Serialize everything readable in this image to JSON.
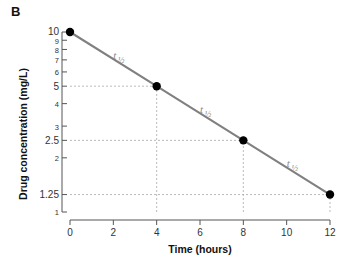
{
  "figure": {
    "panel_label": "B",
    "xlabel": "Time (hours)",
    "ylabel": "Drug concentration (mg/L)"
  },
  "colors": {
    "line": "#808080",
    "point": "#000000",
    "axis": "#555555",
    "guide": "#aaaaaa",
    "annotation": "#8c8c8c",
    "text": "#111111",
    "background": "#ffffff"
  },
  "chart_data": {
    "type": "line",
    "title": "",
    "subtitle": "",
    "panel": "B",
    "xlabel": "Time (hours)",
    "ylabel": "Drug concentration (mg/L)",
    "yscale": "log",
    "xscale": "linear",
    "xlim": [
      0,
      12
    ],
    "ylim": [
      1,
      10
    ],
    "grid": false,
    "legend": "none",
    "x": [
      0,
      4,
      8,
      12
    ],
    "values": [
      10,
      5,
      2.5,
      1.25
    ],
    "series": [
      {
        "name": "Drug concentration",
        "x": [
          0,
          4,
          8,
          12
        ],
        "values": [
          10,
          5,
          2.5,
          1.25
        ],
        "marker": "filled-circle"
      }
    ],
    "xticks": [
      0,
      2,
      4,
      6,
      8,
      10,
      12
    ],
    "xticklabels": [
      "0",
      "2",
      "4",
      "6",
      "8",
      "10",
      "12"
    ],
    "yticks": [
      10,
      9,
      8,
      7,
      6,
      5,
      4,
      3,
      2.5,
      2,
      1.25,
      1
    ],
    "yticklabels": [
      "10",
      "9",
      "8",
      "7",
      "6",
      "5",
      "4",
      "3",
      "2.5",
      "2",
      "1.25",
      "1"
    ],
    "annotations": [
      {
        "text": "t",
        "subscript": "1/2",
        "x_data": 2,
        "y_data": 7.1
      },
      {
        "text": "t",
        "subscript": "1/2",
        "x_data": 6,
        "y_data": 3.55
      },
      {
        "text": "t",
        "subscript": "1/2",
        "x_data": 10,
        "y_data": 1.78
      }
    ],
    "guide_lines": [
      {
        "type": "horizontal",
        "y": 5,
        "from_x": 0,
        "to_x": 4
      },
      {
        "type": "vertical",
        "x": 4,
        "from_y": 1,
        "to_y": 5
      },
      {
        "type": "horizontal",
        "y": 2.5,
        "from_x": 0,
        "to_x": 8
      },
      {
        "type": "vertical",
        "x": 8,
        "from_y": 1,
        "to_y": 2.5
      },
      {
        "type": "horizontal",
        "y": 1.25,
        "from_x": 0,
        "to_x": 12
      },
      {
        "type": "vertical",
        "x": 12,
        "from_y": 1,
        "to_y": 1.25
      }
    ]
  }
}
